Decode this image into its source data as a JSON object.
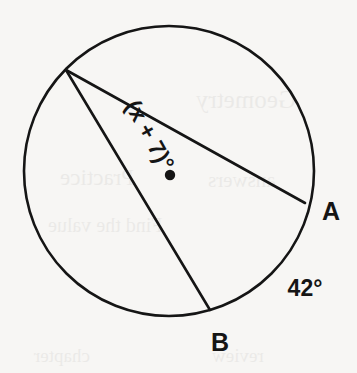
{
  "figure": {
    "type": "circle-geometry-diagram",
    "background_color": "#f7f6f4",
    "ink_color": "#151515",
    "circle": {
      "name": "circle-outline",
      "center_x": 169,
      "center_y": 171,
      "radius": 145,
      "stroke_width": 2.6
    },
    "center_dot": {
      "name": "circle-center-dot",
      "cx": 170,
      "cy": 175,
      "r": 5.2
    },
    "vertex": {
      "name": "chord-apex-vertex",
      "x": 66,
      "y": 70
    },
    "chords": [
      {
        "name": "chord-to-a",
        "x1": 66,
        "y1": 70,
        "x2": 305,
        "y2": 203,
        "stroke_width": 2.6
      },
      {
        "name": "chord-to-b",
        "x1": 66,
        "y1": 70,
        "x2": 210,
        "y2": 310,
        "stroke_width": 2.6
      }
    ],
    "labels": {
      "point_a": {
        "text": "A",
        "x": 331,
        "y": 220,
        "font_size": 25
      },
      "point_b": {
        "text": "B",
        "x": 220,
        "y": 351,
        "font_size": 25
      },
      "arc_measure": {
        "text": "42°",
        "x": 305,
        "y": 296,
        "font_size": 23
      },
      "inscribed_angle": {
        "text": "(x + 7)°",
        "x": 143,
        "y": 139,
        "font_size": 23,
        "rotation_degrees": 61
      }
    },
    "ghost_artifacts": [
      {
        "text": "Geometry",
        "x": 196,
        "y": 86,
        "size": 25
      },
      {
        "text": "Practice",
        "x": 60,
        "y": 165,
        "size": 23
      },
      {
        "text": "answers",
        "x": 208,
        "y": 168,
        "size": 21
      },
      {
        "text": "Find the value",
        "x": 48,
        "y": 214,
        "size": 20
      },
      {
        "text": "chapter",
        "x": 34,
        "y": 345,
        "size": 19
      },
      {
        "text": "review",
        "x": 212,
        "y": 345,
        "size": 19
      }
    ]
  }
}
